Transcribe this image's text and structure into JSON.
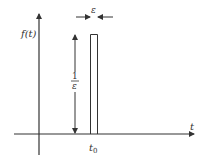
{
  "diagram": {
    "y_axis_label": "f(t)",
    "x_axis_label": "t",
    "pulse_position_label": "t",
    "pulse_position_subscript": "0",
    "height_label_numerator": "1",
    "height_label_denominator": "ε",
    "width_label": "ε",
    "colors": {
      "stroke": "#333333",
      "background": "#ffffff"
    }
  }
}
